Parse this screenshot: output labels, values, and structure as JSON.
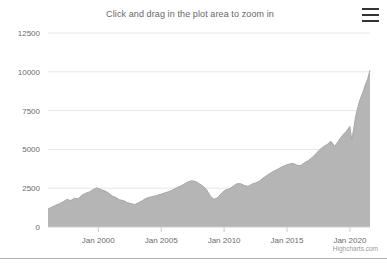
{
  "chart": {
    "title": "Click and drag in the plot area to zoom in",
    "credits": "Highcharts.com",
    "menu_icon": "hamburger-menu-icon"
  },
  "colors": {
    "area_fill": "#b5b5b5",
    "area_line": "#a8a8a8",
    "gridline": "#e6e6e6",
    "axis_line": "#cccccc",
    "label_text": "#6b6b6b",
    "title_text": "#666666",
    "credits_text": "#999999",
    "menu_bar": "#333333"
  },
  "chart_data": {
    "type": "area",
    "title": "Click and drag in the plot area to zoom in",
    "subtitle": "",
    "xlabel": "",
    "ylabel": "",
    "grid": true,
    "legend": false,
    "xlim": [
      1996.0,
      2021.6
    ],
    "ylim": [
      0,
      12500
    ],
    "ytick_labels": [
      "0",
      "2500",
      "5000",
      "7500",
      "10000",
      "12500"
    ],
    "ytick_values": [
      0,
      2500,
      5000,
      7500,
      10000,
      12500
    ],
    "xtick_labels": [
      "Jan 2000",
      "Jan 2005",
      "Jan 2010",
      "Jan 2015",
      "Jan 2020"
    ],
    "xtick_values": [
      2000,
      2005,
      2010,
      2015,
      2020
    ],
    "series": [
      {
        "name": "Index",
        "x": [
          1996.0,
          1996.3,
          1996.6,
          1996.9,
          1997.2,
          1997.5,
          1997.8,
          1998.1,
          1998.4,
          1998.7,
          1999.0,
          1999.3,
          1999.6,
          1999.9,
          2000.2,
          2000.5,
          2000.8,
          2001.1,
          2001.4,
          2001.7,
          2002.0,
          2002.3,
          2002.6,
          2002.9,
          2003.2,
          2003.5,
          2003.8,
          2004.1,
          2004.4,
          2004.7,
          2005.0,
          2005.3,
          2005.6,
          2005.9,
          2006.2,
          2006.5,
          2006.8,
          2007.1,
          2007.4,
          2007.7,
          2008.0,
          2008.3,
          2008.6,
          2008.9,
          2009.2,
          2009.5,
          2009.8,
          2010.1,
          2010.4,
          2010.7,
          2011.0,
          2011.3,
          2011.6,
          2011.9,
          2012.2,
          2012.5,
          2012.8,
          2013.1,
          2013.4,
          2013.7,
          2014.0,
          2014.3,
          2014.6,
          2014.9,
          2015.2,
          2015.5,
          2015.8,
          2016.1,
          2016.4,
          2016.7,
          2017.0,
          2017.3,
          2017.6,
          2017.9,
          2018.2,
          2018.5,
          2018.8,
          2019.1,
          2019.4,
          2019.7,
          2020.0,
          2020.15,
          2020.3,
          2020.45,
          2020.6,
          2020.8,
          2021.0,
          2021.2,
          2021.4,
          2021.6
        ],
        "y": [
          1150,
          1280,
          1400,
          1500,
          1620,
          1780,
          1700,
          1850,
          1820,
          2050,
          2180,
          2260,
          2420,
          2520,
          2420,
          2330,
          2200,
          2000,
          1900,
          1750,
          1700,
          1580,
          1500,
          1450,
          1560,
          1700,
          1850,
          1920,
          1980,
          2040,
          2120,
          2200,
          2280,
          2380,
          2520,
          2620,
          2760,
          2900,
          2980,
          2940,
          2800,
          2640,
          2420,
          2000,
          1780,
          1900,
          2180,
          2380,
          2450,
          2620,
          2780,
          2800,
          2680,
          2620,
          2760,
          2840,
          2950,
          3150,
          3320,
          3480,
          3620,
          3740,
          3880,
          3980,
          4060,
          4100,
          3980,
          3960,
          4150,
          4280,
          4480,
          4720,
          4980,
          5180,
          5320,
          5520,
          5200,
          5550,
          5900,
          6150,
          6480,
          5600,
          6300,
          7100,
          7600,
          8200,
          8600,
          9100,
          9500,
          10100
        ],
        "fill": true
      }
    ]
  },
  "layout": {
    "plot_left": 48,
    "plot_right": 370,
    "plot_top": 33,
    "plot_bottom": 227
  }
}
